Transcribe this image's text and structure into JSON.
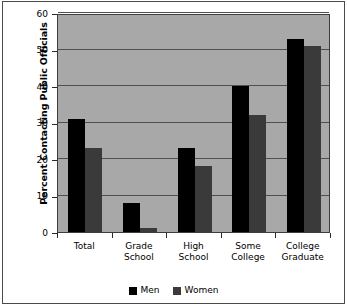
{
  "chart_data": {
    "type": "bar",
    "title": "",
    "subtitle": "",
    "xlabel": "",
    "ylabel": "Percent Contacting Public Officials",
    "categories": [
      "Total",
      "Grade School",
      "High School",
      "Some College",
      "College Graduate"
    ],
    "category_lines": [
      [
        "Total"
      ],
      [
        "Grade",
        "School"
      ],
      [
        "High",
        "School"
      ],
      [
        "Some",
        "College"
      ],
      [
        "College",
        "Graduate"
      ]
    ],
    "series": [
      {
        "name": "Men",
        "color": "#000000",
        "values": [
          31,
          8,
          23,
          40,
          53
        ]
      },
      {
        "name": "Women",
        "color": "#3a3a3a",
        "values": [
          23,
          1,
          18,
          32,
          51
        ]
      }
    ],
    "ylim": [
      0,
      60
    ],
    "ytick_values": [
      0,
      10,
      20,
      30,
      40,
      50,
      60
    ],
    "ytick_labels": [
      "0",
      "10",
      "20",
      "30",
      "40",
      "50",
      "60"
    ],
    "grid": true,
    "grid_axis": "y",
    "legend_position": "bottom-center",
    "plot_background": "#a8a8a8",
    "figure_background": "#ffffff"
  },
  "legend": {
    "items": [
      {
        "label": "Men"
      },
      {
        "label": "Women"
      }
    ]
  }
}
